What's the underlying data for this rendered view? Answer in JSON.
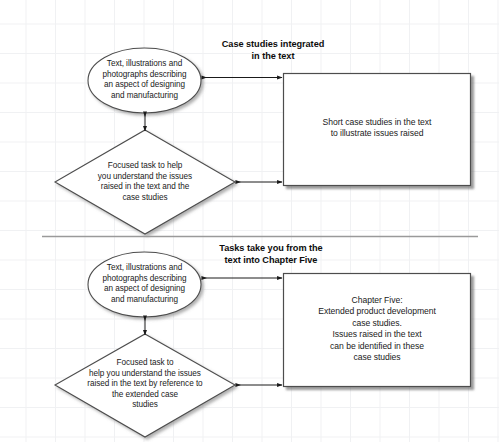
{
  "diagram": {
    "background": "#ffffff",
    "grid_color": "#f0f1f3",
    "shape_fill": "#ffffff",
    "shape_stroke": "#4d4d4d",
    "text_color": "#1a1a1a",
    "divider_color": "#999999"
  },
  "sections": [
    {
      "id": "section-top",
      "caption": "Case studies integrated\nin the text",
      "ellipse": {
        "label": "Text, illustrations and\nphotographs describing\nan aspect of designing\nand manufacturing",
        "shape": "ellipse"
      },
      "diamond": {
        "label": "Focused task to help\nyou understand the issues\nraised in the text and the\ncase studies",
        "shape": "diamond"
      },
      "rectangle": {
        "label": "Short case studies in the text\nto illustrate issues raised",
        "shape": "rectangle"
      },
      "connectors": [
        {
          "id": "ellipse-to-rectangle",
          "type": "double-arrow",
          "orientation": "horizontal"
        },
        {
          "id": "ellipse-to-diamond",
          "type": "double-arrow",
          "orientation": "vertical"
        },
        {
          "id": "diamond-to-rectangle",
          "type": "double-arrow",
          "orientation": "horizontal"
        }
      ]
    },
    {
      "id": "section-bottom",
      "caption": "Tasks take you from the\ntext into Chapter Five",
      "ellipse": {
        "label": "Text, illustrations and\nphotographs describing\nan aspect of designing\nand manufacturing",
        "shape": "ellipse"
      },
      "diamond": {
        "label": "Focused task to\nhelp you understand the issues\nraised in the text by reference to\nthe extended case\nstudies",
        "shape": "diamond"
      },
      "rectangle": {
        "label": "Chapter Five:\nExtended product development\ncase studies.\nIssues raised in the text\ncan be identified in these\ncase studies",
        "shape": "rectangle"
      },
      "connectors": [
        {
          "id": "ellipse-to-rectangle",
          "type": "double-arrow",
          "orientation": "horizontal"
        },
        {
          "id": "ellipse-to-diamond",
          "type": "double-arrow",
          "orientation": "vertical"
        },
        {
          "id": "diamond-to-rectangle",
          "type": "double-arrow",
          "orientation": "horizontal"
        }
      ]
    }
  ],
  "divider": {
    "id": "section-divider",
    "label": ""
  }
}
